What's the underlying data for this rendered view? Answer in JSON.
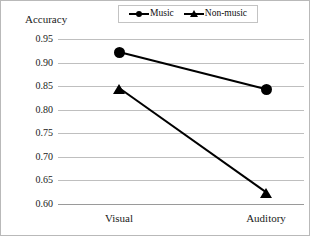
{
  "chart_data": {
    "type": "line",
    "title": "",
    "xlabel": "",
    "ylabel": "Accuracy",
    "categories": [
      "Visual",
      "Auditory"
    ],
    "series": [
      {
        "name": "Music",
        "marker": "circle",
        "values": [
          0.921,
          0.842
        ]
      },
      {
        "name": "Non-music",
        "marker": "triangle",
        "values": [
          0.845,
          0.624
        ]
      }
    ],
    "ylim": [
      0.6,
      0.95
    ],
    "yticks": [
      "0.95",
      "0.90",
      "0.85",
      "0.80",
      "0.75",
      "0.70",
      "0.65",
      "0.60"
    ],
    "ytick_values": [
      0.95,
      0.9,
      0.85,
      0.8,
      0.75,
      0.7,
      0.65,
      0.6
    ],
    "grid": true,
    "legend_position": "top-center",
    "line_color": "#000000",
    "grid_color": "#bfbfbf"
  },
  "legend": {
    "entries": [
      {
        "label": "Music"
      },
      {
        "label": "Non-music"
      }
    ]
  },
  "axis": {
    "ylabel": "Accuracy",
    "yticks": [
      "0.95",
      "0.90",
      "0.85",
      "0.80",
      "0.75",
      "0.70",
      "0.65",
      "0.60"
    ],
    "xticks": [
      "Visual",
      "Auditory"
    ]
  }
}
